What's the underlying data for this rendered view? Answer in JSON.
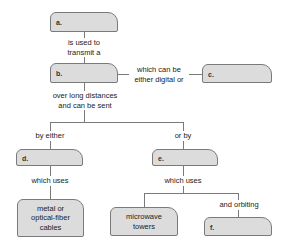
{
  "concept_map": {
    "nodes": {
      "a": {
        "label": "a.",
        "text": ""
      },
      "b": {
        "label": "b.",
        "text": ""
      },
      "c": {
        "label": "c.",
        "text": ""
      },
      "d": {
        "label": "d.",
        "text": ""
      },
      "e": {
        "label": "e.",
        "text": ""
      },
      "f": {
        "label": "f.",
        "text": ""
      },
      "cables": {
        "text": "metal or optical-fiber cables"
      },
      "towers": {
        "text": "microwave towers"
      }
    },
    "links": {
      "a_b_1": "is used to",
      "a_b_2": "transmit a",
      "b_c_1": "which can be",
      "b_c_2": "either digital or",
      "b_split_1": "over long distances",
      "b_split_2": "and can be sent",
      "to_d": "by either",
      "to_e": "or by",
      "d_uses": "which uses",
      "e_uses": "which uses",
      "to_f": "and orbiting"
    },
    "cables_lines": [
      "metal or",
      "optical-fiber",
      "cables"
    ],
    "towers_lines": [
      "microwave",
      "towers"
    ]
  }
}
